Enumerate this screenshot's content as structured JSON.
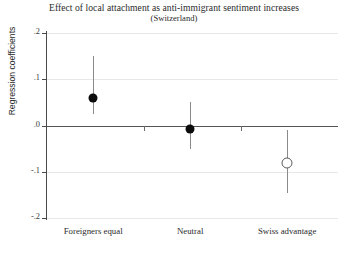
{
  "chart_data": {
    "type": "scatter",
    "title": "Effect of local attachment as anti-immigrant sentiment increases",
    "subtitle": "(Switzerland)",
    "xlabel": "",
    "ylabel": "Regression coefficients",
    "categories": [
      "Foreigners equal",
      "Neutral",
      "Swiss advantage"
    ],
    "ylim": [
      -0.2,
      0.2
    ],
    "yticks": [
      ".2",
      ".1",
      ".0",
      "-.1",
      "-.2"
    ],
    "ytick_values": [
      0.2,
      0.1,
      0.0,
      -0.1,
      -0.2
    ],
    "grid": true,
    "legend": "none",
    "zero_line": true,
    "series": [
      {
        "name": "Regression coefficient",
        "values": [
          0.06,
          -0.007,
          -0.08
        ],
        "ci_low": [
          0.025,
          -0.05,
          -0.145
        ],
        "ci_high": [
          0.15,
          0.05,
          -0.01
        ],
        "marker_styles": [
          "filled",
          "filled",
          "hollow"
        ]
      }
    ],
    "colors": {
      "marker_filled": "#0b0b0b",
      "marker_hollow_edge": "#5a5a5a",
      "ci_bar": "#8a8a8a",
      "gridline": "#e8e8e8",
      "zero_line": "#555555",
      "axis": "#4a4a4a",
      "text": "#2b2b2b",
      "background": "#ffffff"
    }
  }
}
